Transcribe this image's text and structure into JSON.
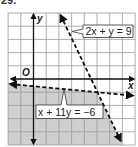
{
  "problem": {
    "number": "29."
  },
  "graph": {
    "x_axis_label": "x",
    "y_axis_label": "y",
    "origin_label": "O",
    "x_range": [
      -2,
      8
    ],
    "y_range": [
      -5,
      5
    ],
    "grid_step": 1,
    "shade_color": "#cfcfcf",
    "grid_color": "#9a9a9a",
    "line_color": "#111111"
  },
  "lines": [
    {
      "label": "2x + y = 9",
      "equation": "2x + y = 9",
      "style": "dashed",
      "points": [
        [
          2,
          5
        ],
        [
          7,
          -5
        ]
      ]
    },
    {
      "label": "x + 11y = −6",
      "equation": "x + 11y = -6",
      "style": "dashed",
      "points": [
        [
          -2,
          -0.364
        ],
        [
          8,
          -1.273
        ]
      ]
    }
  ],
  "shaded_region": {
    "description": "Below x + 11y = -6 and left of 2x + y = 9",
    "vertices": [
      [
        -2,
        -0.364
      ],
      [
        5,
        -1
      ],
      [
        7,
        -5
      ],
      [
        -2,
        -5
      ]
    ]
  }
}
